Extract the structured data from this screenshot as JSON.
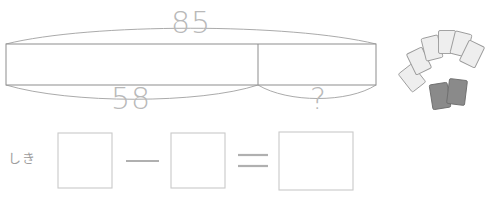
{
  "worksheet": {
    "kind": "tape-diagram-subtraction-problem",
    "language": "ja"
  },
  "tape_diagram": {
    "total_label": "85",
    "known_part_label": "58",
    "unknown_part_label": "?",
    "bar": {
      "x": 6,
      "y": 44,
      "width": 370,
      "height": 41,
      "divider_x": 258
    },
    "stroke_color": "#8d8d8d",
    "fill_color": "#ffffff"
  },
  "equation": {
    "prompt_label": "しき",
    "operator_minus": "−",
    "operator_equals": "=",
    "answer_box_value": "",
    "minuend_box_value": "",
    "subtrahend_box_value": "",
    "boxes": [
      {
        "name": "minuend-box",
        "x": 58,
        "y": 133,
        "width": 54,
        "height": 55
      },
      {
        "name": "subtrahend-box",
        "x": 171,
        "y": 133,
        "width": 54,
        "height": 55
      },
      {
        "name": "answer-box",
        "x": 279,
        "y": 132,
        "width": 74,
        "height": 58
      }
    ],
    "box_stroke_color": "#c9c9c9",
    "operator_color": "#b0b0b0"
  },
  "illustration": {
    "name": "fanned-cards",
    "light_card_count": 6,
    "dark_card_count": 2,
    "light_card_fill": "#eeeeee",
    "light_card_stroke": "#9a9a9a",
    "dark_card_fill": "#8a8a8a",
    "dark_card_stroke": "#6d6d6d",
    "light_cards": [
      {
        "cx": 412,
        "cy": 78,
        "w": 17,
        "h": 23,
        "rot": -38
      },
      {
        "cx": 419,
        "cy": 61,
        "w": 17,
        "h": 23,
        "rot": -26
      },
      {
        "cx": 432,
        "cy": 48,
        "w": 17,
        "h": 23,
        "rot": -14
      },
      {
        "cx": 447,
        "cy": 42,
        "w": 17,
        "h": 23,
        "rot": 0
      },
      {
        "cx": 461,
        "cy": 44,
        "w": 17,
        "h": 23,
        "rot": 14
      },
      {
        "cx": 472,
        "cy": 54,
        "w": 17,
        "h": 23,
        "rot": 26
      }
    ],
    "dark_cards": [
      {
        "cx": 440,
        "cy": 96,
        "w": 18,
        "h": 25,
        "rot": -9
      },
      {
        "cx": 457,
        "cy": 92,
        "w": 18,
        "h": 25,
        "rot": 7
      }
    ]
  }
}
